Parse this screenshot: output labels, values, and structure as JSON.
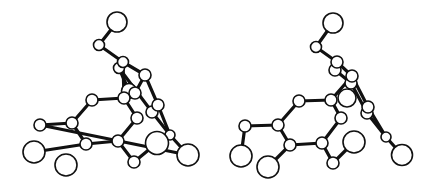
{
  "figure": {
    "type": "stereo-pair ball-and-stick molecular structure",
    "background": "#ffffff",
    "ink": "#111111",
    "views": [
      {
        "id": "left",
        "atoms": [
          {
            "x": 117,
            "y": 22,
            "r": 10
          },
          {
            "x": 99,
            "y": 45,
            "r": 5.5
          },
          {
            "x": 119,
            "y": 68,
            "r": 5.5
          },
          {
            "x": 123,
            "y": 62,
            "r": 5.5
          },
          {
            "x": 129,
            "y": 91,
            "r": 7.5
          },
          {
            "x": 145,
            "y": 75,
            "r": 6
          },
          {
            "x": 135,
            "y": 93,
            "r": 6
          },
          {
            "x": 124,
            "y": 98,
            "r": 6
          },
          {
            "x": 92,
            "y": 100,
            "r": 6
          },
          {
            "x": 152,
            "y": 112,
            "r": 6
          },
          {
            "x": 158,
            "y": 105,
            "r": 6
          },
          {
            "x": 137,
            "y": 118,
            "r": 6
          },
          {
            "x": 40,
            "y": 125,
            "r": 6
          },
          {
            "x": 72,
            "y": 123,
            "r": 6
          },
          {
            "x": 86,
            "y": 144,
            "r": 6
          },
          {
            "x": 118,
            "y": 141,
            "r": 6
          },
          {
            "x": 170,
            "y": 135,
            "r": 5
          },
          {
            "x": 157,
            "y": 143,
            "r": 11.5
          },
          {
            "x": 188,
            "y": 155,
            "r": 11
          },
          {
            "x": 34,
            "y": 152,
            "r": 11
          },
          {
            "x": 66,
            "y": 165,
            "r": 11
          },
          {
            "x": 134,
            "y": 162,
            "r": 6
          }
        ],
        "bonds": [
          [
            0,
            1
          ],
          [
            1,
            3
          ],
          [
            3,
            5
          ],
          [
            2,
            4
          ],
          [
            5,
            6
          ],
          [
            3,
            7
          ],
          [
            7,
            8
          ],
          [
            7,
            11
          ],
          [
            8,
            13
          ],
          [
            13,
            12
          ],
          [
            12,
            18
          ],
          [
            13,
            14
          ],
          [
            14,
            19
          ],
          [
            14,
            15
          ],
          [
            11,
            15
          ],
          [
            15,
            21
          ],
          [
            21,
            17
          ],
          [
            5,
            10
          ],
          [
            10,
            16
          ],
          [
            16,
            18
          ],
          [
            2,
            9
          ],
          [
            9,
            16
          ]
        ]
      },
      {
        "id": "right",
        "atoms": [
          {
            "x": 333,
            "y": 23,
            "r": 10
          },
          {
            "x": 316,
            "y": 47,
            "r": 5.5
          },
          {
            "x": 335,
            "y": 70,
            "r": 6
          },
          {
            "x": 337,
            "y": 62,
            "r": 6
          },
          {
            "x": 347,
            "y": 98,
            "r": 9
          },
          {
            "x": 351,
            "y": 83,
            "r": 6
          },
          {
            "x": 352,
            "y": 76,
            "r": 6
          },
          {
            "x": 331,
            "y": 100,
            "r": 6
          },
          {
            "x": 299,
            "y": 101,
            "r": 6
          },
          {
            "x": 367,
            "y": 113,
            "r": 6
          },
          {
            "x": 368,
            "y": 107,
            "r": 6
          },
          {
            "x": 341,
            "y": 118,
            "r": 6
          },
          {
            "x": 245,
            "y": 126,
            "r": 6
          },
          {
            "x": 278,
            "y": 125,
            "r": 6
          },
          {
            "x": 290,
            "y": 145,
            "r": 6
          },
          {
            "x": 322,
            "y": 143,
            "r": 6
          },
          {
            "x": 386,
            "y": 137,
            "r": 5
          },
          {
            "x": 354,
            "y": 142,
            "r": 11
          },
          {
            "x": 402,
            "y": 155,
            "r": 10.5
          },
          {
            "x": 241,
            "y": 156,
            "r": 11
          },
          {
            "x": 268,
            "y": 167,
            "r": 11
          },
          {
            "x": 333,
            "y": 163,
            "r": 6
          }
        ],
        "bonds": [
          [
            0,
            1
          ],
          [
            1,
            3
          ],
          [
            3,
            6
          ],
          [
            2,
            5
          ],
          [
            6,
            7
          ],
          [
            7,
            8
          ],
          [
            7,
            11
          ],
          [
            8,
            13
          ],
          [
            13,
            12
          ],
          [
            12,
            19
          ],
          [
            13,
            14
          ],
          [
            14,
            20
          ],
          [
            14,
            15
          ],
          [
            11,
            15
          ],
          [
            15,
            21
          ],
          [
            21,
            17
          ],
          [
            6,
            10
          ],
          [
            10,
            16
          ],
          [
            16,
            18
          ],
          [
            5,
            9
          ],
          [
            9,
            16
          ]
        ]
      }
    ]
  }
}
